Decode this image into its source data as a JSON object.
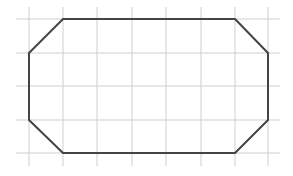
{
  "diagram": {
    "type": "octagon-on-grid",
    "background": "#ffffff",
    "grid": {
      "color": "#cfcfcf",
      "vertical_x": [
        29,
        63,
        97,
        132,
        166,
        201,
        235,
        268
      ],
      "horizontal_y": [
        19,
        53,
        86,
        120,
        153
      ],
      "x_extent": [
        16,
        280
      ],
      "y_extent": [
        7,
        166
      ]
    },
    "shape": {
      "name": "octagon",
      "stroke": "#444444",
      "stroke_width": 2,
      "points": [
        [
          63,
          19
        ],
        [
          235,
          19
        ],
        [
          268,
          53
        ],
        [
          268,
          120
        ],
        [
          235,
          153
        ],
        [
          63,
          153
        ],
        [
          29,
          120
        ],
        [
          29,
          53
        ]
      ]
    }
  }
}
